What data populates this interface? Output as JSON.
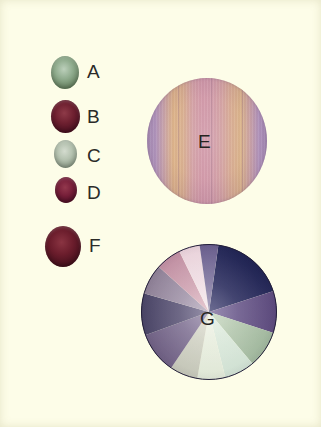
{
  "figure": {
    "background_color": "#fdfde8",
    "label_color": "#2b2b28"
  },
  "specimens": [
    {
      "label": "A",
      "name": "specimen-a",
      "color_light": "#bcd0bb",
      "color_mid": "#8fab8d",
      "color_dark": "#65805f",
      "left": 51,
      "top": 56,
      "width": 28,
      "height": 33,
      "label_left": 87,
      "label_top": 62
    },
    {
      "label": "B",
      "name": "specimen-b",
      "color_light": "#8e3a48",
      "color_mid": "#6e2030",
      "color_dark": "#4a1020",
      "left": 51,
      "top": 100,
      "width": 29,
      "height": 33,
      "label_left": 87,
      "label_top": 107
    },
    {
      "label": "C",
      "name": "specimen-c",
      "color_light": "#d4dccf",
      "color_mid": "#b5c2b0",
      "color_dark": "#8d9c88",
      "left": 54,
      "top": 140,
      "width": 23,
      "height": 28,
      "label_left": 87,
      "label_top": 146
    },
    {
      "label": "D",
      "name": "specimen-d",
      "color_light": "#93384d",
      "color_mid": "#78203a",
      "color_dark": "#521027",
      "left": 55,
      "top": 177,
      "width": 22,
      "height": 26,
      "label_left": 87,
      "label_top": 183
    },
    {
      "label": "F",
      "name": "specimen-f",
      "color_light": "#8a3442",
      "color_mid": "#6b1d2c",
      "color_dark": "#44101c",
      "left": 45,
      "top": 226,
      "width": 36,
      "height": 41,
      "label_left": 89,
      "label_top": 236
    }
  ],
  "circle_e": {
    "label": "E",
    "label_left": 198,
    "label_top": 132,
    "bands": [
      {
        "offset": 0,
        "color": "#a48bb4"
      },
      {
        "offset": 7,
        "color": "#b094bd"
      },
      {
        "offset": 14,
        "color": "#c9a3a8"
      },
      {
        "offset": 22,
        "color": "#dcb184"
      },
      {
        "offset": 30,
        "color": "#d9ae8c"
      },
      {
        "offset": 38,
        "color": "#d3a0a4"
      },
      {
        "offset": 46,
        "color": "#d298a8"
      },
      {
        "offset": 54,
        "color": "#d29ba9"
      },
      {
        "offset": 62,
        "color": "#d4a2a2"
      },
      {
        "offset": 70,
        "color": "#d8ab90"
      },
      {
        "offset": 78,
        "color": "#dab286"
      },
      {
        "offset": 86,
        "color": "#c9a0a4"
      },
      {
        "offset": 93,
        "color": "#b194bd"
      },
      {
        "offset": 100,
        "color": "#a088b2"
      }
    ],
    "streak_positions": [
      26,
      53,
      79
    ]
  },
  "pie_g": {
    "label": "G",
    "label_left": 200,
    "label_top": 309,
    "sectors": [
      {
        "name": "sector-navy-upper-right",
        "start_deg": 8,
        "end_deg": 72,
        "color_outer": "#1f2352",
        "color_inner": "#4a4a78"
      },
      {
        "name": "sector-violet-right",
        "start_deg": 72,
        "end_deg": 108,
        "color_outer": "#5c4a7c",
        "color_inner": "#8273a0"
      },
      {
        "name": "sector-sage-lower-right",
        "start_deg": 108,
        "end_deg": 140,
        "color_outer": "#9fb69c",
        "color_inner": "#cbdac4"
      },
      {
        "name": "sector-mint-lower",
        "start_deg": 140,
        "end_deg": 166,
        "color_outer": "#cfe0d2",
        "color_inner": "#e6f0e4"
      },
      {
        "name": "sector-cream-bottom",
        "start_deg": 166,
        "end_deg": 190,
        "color_outer": "#dfe7d6",
        "color_inner": "#f1f4e8"
      },
      {
        "name": "sector-pale-bottom-left",
        "start_deg": 190,
        "end_deg": 214,
        "color_outer": "#c3c5b7",
        "color_inner": "#e0e0d4"
      },
      {
        "name": "sector-mauve-lower-left",
        "start_deg": 214,
        "end_deg": 250,
        "color_outer": "#6e5f82",
        "color_inner": "#9b8fac"
      },
      {
        "name": "sector-slate-left",
        "start_deg": 250,
        "end_deg": 286,
        "color_outer": "#4a4566",
        "color_inner": "#7d7694"
      },
      {
        "name": "sector-grey-upper-left",
        "start_deg": 286,
        "end_deg": 312,
        "color_outer": "#8e8096",
        "color_inner": "#b9aec0"
      },
      {
        "name": "sector-rose-upper-left",
        "start_deg": 312,
        "end_deg": 334,
        "color_outer": "#c08fa2",
        "color_inner": "#e0bcc6"
      },
      {
        "name": "sector-blush-top",
        "start_deg": 334,
        "end_deg": 352,
        "color_outer": "#e9d2da",
        "color_inner": "#f6eaee"
      },
      {
        "name": "sector-plum-top",
        "start_deg": 352,
        "end_deg": 368,
        "color_outer": "#6a5f8e",
        "color_inner": "#9b93b4"
      }
    ]
  }
}
